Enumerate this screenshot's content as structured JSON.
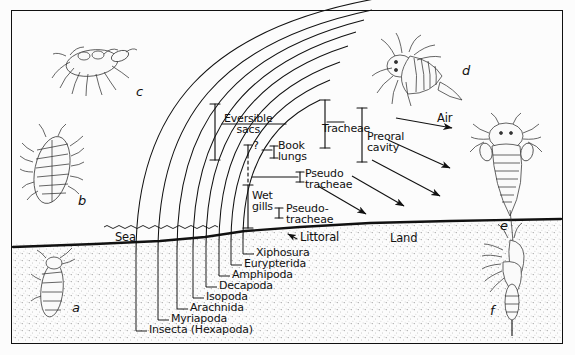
{
  "figure": {
    "background_color": "#fcfcfc",
    "ink_color": "#111111",
    "border_color": "#111111"
  },
  "environment_labels": {
    "sea": "Sea",
    "littoral": "Littoral",
    "land": "Land",
    "air": "Air"
  },
  "respiratory_structures": [
    {
      "id": "eversible-sacs",
      "label": "Eversible\nsacs"
    },
    {
      "id": "question-mark",
      "label": "?"
    },
    {
      "id": "book-lungs",
      "label": "Book\nlungs"
    },
    {
      "id": "tracheae",
      "label": "Tracheae"
    },
    {
      "id": "preoral-cavity",
      "label": "Preoral\ncavity"
    },
    {
      "id": "pseudotracheae-upper",
      "label": "Pseudo\ntracheae"
    },
    {
      "id": "wet-gills",
      "label": "Wet\ngills"
    },
    {
      "id": "pseudotracheae-lower",
      "label": "Pseudo-\ntracheae"
    }
  ],
  "taxa": [
    {
      "order": 1,
      "label": "Xiphosura"
    },
    {
      "order": 2,
      "label": "Eurypterida"
    },
    {
      "order": 3,
      "label": "Amphipoda"
    },
    {
      "order": 4,
      "label": "Decapoda"
    },
    {
      "order": 5,
      "label": "Isopoda"
    },
    {
      "order": 6,
      "label": "Arachnida"
    },
    {
      "order": 7,
      "label": "Myriapoda"
    },
    {
      "order": 8,
      "label": "Insecta (Hexapoda)"
    }
  ],
  "specimens": [
    {
      "key": "a",
      "label": "a",
      "description": "small elongate arthropod"
    },
    {
      "key": "b",
      "label": "b",
      "description": "segmented isopod"
    },
    {
      "key": "c",
      "label": "c",
      "description": "decapod crab"
    },
    {
      "key": "d",
      "label": "d",
      "description": "eurypterid"
    },
    {
      "key": "e",
      "label": "e",
      "description": "scorpion-like arachnid"
    },
    {
      "key": "f",
      "label": "f",
      "description": "insect hexapod"
    }
  ]
}
